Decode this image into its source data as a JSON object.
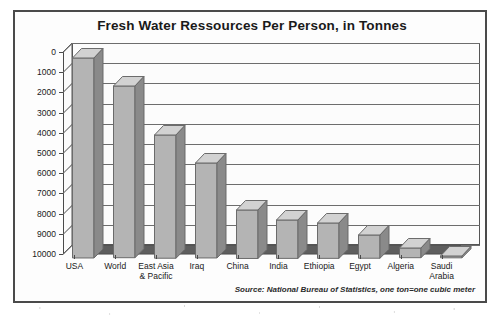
{
  "chart_data": {
    "type": "bar",
    "title": "Fresh Water Ressources Per Person, in Tonnes",
    "xlabel": "",
    "ylabel": "",
    "ylim": [
      0,
      10000
    ],
    "ytick_step": 1000,
    "yticks": [
      "10000",
      "9000",
      "8000",
      "7000",
      "6000",
      "5000",
      "4000",
      "3000",
      "2000",
      "1000",
      "0"
    ],
    "grid": true,
    "legend": "none",
    "style": "3d-column",
    "categories": [
      "USA",
      "World",
      "East Asia\n& Pacific",
      "Iraq",
      "China",
      "India",
      "Ethiopia",
      "Egypt",
      "Algeria",
      "Saudi\nArabia"
    ],
    "values": [
      9900,
      8500,
      6100,
      4700,
      2400,
      1900,
      1750,
      1150,
      480,
      90
    ],
    "source_note": "Source: National Bureau of Statistics, one ton=one cubic meter"
  },
  "colors": {
    "bar_fill": "#b4b4b4",
    "bar_top": "#d2d2d2",
    "bar_side": "#8a8a8a",
    "bar_outline": "#6a6a6a",
    "floor": "#5e5e5e",
    "floor_front": "#8f8f8f",
    "grid": "#6d6d6d",
    "axis": "#4a4a4a",
    "frame": "#4a4a4a",
    "plot_bg": "#fcfcfc",
    "page_bg": "#ffffff",
    "text": "#1a1a1a"
  }
}
